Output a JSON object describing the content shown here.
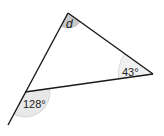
{
  "diagram": {
    "type": "triangle-angles",
    "colors": {
      "line": "#1a1a1a",
      "arc_fill_dark": "#c8c8c8",
      "arc_fill_light": "#e6e6e6",
      "arc_stroke": "#bdbdbd",
      "background": "#ffffff"
    },
    "vertices": {
      "top": {
        "x": 68,
        "y": 13
      },
      "right": {
        "x": 153,
        "y": 74
      },
      "bottom_left": {
        "x": 25,
        "y": 92
      }
    },
    "extension_end": {
      "x": 8,
      "y": 125
    },
    "labels": {
      "top_angle": "d",
      "right_angle": "43°",
      "exterior_angle": "128°"
    }
  }
}
